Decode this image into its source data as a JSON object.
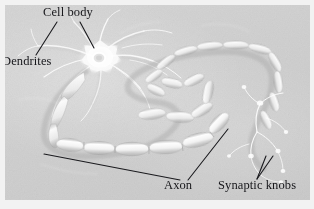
{
  "figure": {
    "background_color": "#d2d2d2",
    "border_color": "#f2f2f2",
    "label_color": "#16161a",
    "leader_color": "#1a1a1e"
  },
  "labels": [
    {
      "id": "cell-body",
      "text": "Cell body"
    },
    {
      "id": "dendrites",
      "text": "Dendrites"
    },
    {
      "id": "axon",
      "text": "Axon"
    },
    {
      "id": "synaptic-knobs",
      "text": "Synaptic knobs"
    }
  ],
  "structures": [
    {
      "id": "soma",
      "name": "cell body (soma)"
    },
    {
      "id": "dendrite",
      "name": "dendrite branches"
    },
    {
      "id": "axon",
      "name": "myelinated axon"
    },
    {
      "id": "myelin",
      "name": "myelin sheath segments"
    },
    {
      "id": "terminals",
      "name": "synaptic knob terminals"
    }
  ]
}
